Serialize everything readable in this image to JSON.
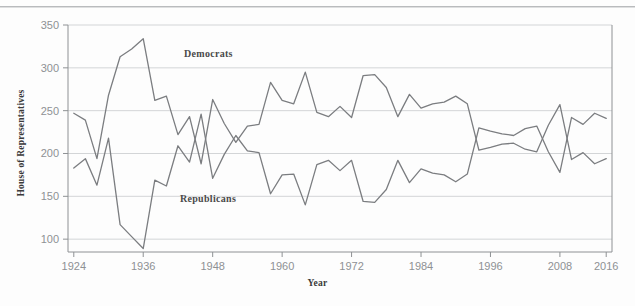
{
  "figure": {
    "background_color": "#fdfdfd",
    "line_color": "#7b7d80",
    "gridline_color": "#d3d5d7",
    "axis_color": "#8e9194",
    "tick_text_color": "#8e9194",
    "label_text_color": "#3a3a3a"
  },
  "labels": {
    "ylabel": "House of Representatives",
    "xlabel": "Year",
    "democrats_annotation": "Democrats",
    "republicans_annotation": "Republicans"
  },
  "chart_data": {
    "type": "line",
    "title": "",
    "subtitle": "",
    "xlabel": "Year",
    "ylabel": "House of Representatives",
    "xlim": [
      1923,
      2017
    ],
    "ylim": [
      85,
      350
    ],
    "xticks": [
      1924,
      1936,
      1948,
      1960,
      1972,
      1984,
      1996,
      2008,
      2016
    ],
    "xtick_labels": [
      "1924",
      "1936",
      "1948",
      "1960",
      "1972",
      "1984",
      "1996",
      "2008",
      "2016"
    ],
    "yticks": [
      100,
      150,
      200,
      250,
      300,
      350
    ],
    "ytick_labels": [
      "100",
      "150",
      "200",
      "250",
      "300",
      "350"
    ],
    "grid": "horizontal",
    "legend": "inline-annotations",
    "legend_position": "inside-plot",
    "x": [
      1924,
      1926,
      1928,
      1930,
      1932,
      1934,
      1936,
      1938,
      1940,
      1942,
      1944,
      1946,
      1948,
      1950,
      1952,
      1954,
      1956,
      1958,
      1960,
      1962,
      1964,
      1966,
      1968,
      1970,
      1972,
      1974,
      1976,
      1978,
      1980,
      1982,
      1984,
      1986,
      1988,
      1990,
      1992,
      1994,
      1996,
      1998,
      2000,
      2002,
      2004,
      2006,
      2008,
      2010,
      2012,
      2014,
      2016
    ],
    "series": [
      {
        "name": "Democrats",
        "values": [
          247,
          239,
          194,
          268,
          313,
          322,
          334,
          262,
          267,
          222,
          243,
          188,
          263,
          235,
          213,
          232,
          234,
          283,
          262,
          258,
          295,
          248,
          243,
          255,
          242,
          291,
          292,
          277,
          243,
          269,
          253,
          258,
          260,
          267,
          258,
          204,
          207,
          211,
          212,
          205,
          202,
          233,
          257,
          193,
          201,
          188,
          194
        ]
      },
      {
        "name": "Republicans",
        "values": [
          183,
          194,
          163,
          218,
          117,
          103,
          89,
          169,
          162,
          209,
          190,
          246,
          171,
          199,
          221,
          203,
          201,
          153,
          175,
          176,
          140,
          187,
          192,
          180,
          192,
          144,
          143,
          158,
          192,
          166,
          182,
          177,
          175,
          167,
          176,
          230,
          226,
          223,
          221,
          229,
          232,
          202,
          178,
          242,
          234,
          247,
          241
        ]
      }
    ]
  }
}
